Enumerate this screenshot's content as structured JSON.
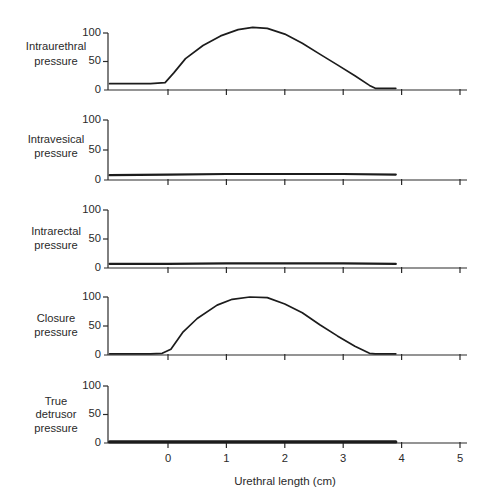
{
  "chart_data": {
    "type": "line",
    "title": "",
    "xlabel": "Urethral length (cm)",
    "xticks": [
      0,
      1,
      2,
      3,
      4,
      5
    ],
    "xlim": [
      -1,
      5.1
    ],
    "grid": false,
    "legend": null,
    "panels": [
      {
        "ylabel": "Intraurethral pressure",
        "ylabel_lines": [
          "Intraurethral",
          "pressure"
        ],
        "yticks": [
          0,
          50,
          100
        ],
        "ylim": [
          0,
          100
        ],
        "x": [
          -1,
          -0.3,
          -0.05,
          0.1,
          0.3,
          0.6,
          0.9,
          1.2,
          1.45,
          1.7,
          2.0,
          2.3,
          2.6,
          2.9,
          3.2,
          3.45,
          3.55,
          3.9
        ],
        "values": [
          11,
          11,
          13,
          30,
          55,
          78,
          95,
          106,
          110,
          108,
          98,
          82,
          63,
          44,
          25,
          8,
          3,
          3
        ]
      },
      {
        "ylabel": "Intravesical pressure",
        "ylabel_lines": [
          "Intravesical",
          "pressure"
        ],
        "yticks": [
          0,
          50,
          100
        ],
        "ylim": [
          0,
          100
        ],
        "x": [
          -1,
          0,
          1,
          2,
          3,
          3.9
        ],
        "values": [
          8,
          9,
          10,
          10,
          10,
          9
        ]
      },
      {
        "ylabel": "Intrarectal pressure",
        "ylabel_lines": [
          "Intrarectal",
          "pressure"
        ],
        "yticks": [
          0,
          50,
          100
        ],
        "ylim": [
          0,
          100
        ],
        "x": [
          -1,
          0,
          1,
          2,
          3,
          3.9
        ],
        "values": [
          7,
          7,
          8,
          8,
          8,
          7
        ]
      },
      {
        "ylabel": "Closure pressure",
        "ylabel_lines": [
          "Closure",
          "pressure"
        ],
        "yticks": [
          0,
          50,
          100
        ],
        "ylim": [
          0,
          100
        ],
        "x": [
          -1,
          -0.3,
          -0.1,
          0.05,
          0.26,
          0.5,
          0.84,
          1.1,
          1.4,
          1.7,
          2.0,
          2.3,
          2.6,
          2.9,
          3.2,
          3.45,
          3.55,
          3.9
        ],
        "values": [
          2,
          2,
          3,
          10,
          40,
          63,
          86,
          96,
          100,
          99,
          88,
          73,
          52,
          33,
          15,
          3,
          2,
          2
        ]
      },
      {
        "ylabel": "True detrusor pressure",
        "ylabel_lines": [
          "True",
          "detrusor",
          "pressure"
        ],
        "yticks": [
          0,
          50,
          100
        ],
        "ylim": [
          0,
          100
        ],
        "x": [
          -1,
          3.9
        ],
        "values": [
          2,
          2
        ]
      }
    ]
  }
}
